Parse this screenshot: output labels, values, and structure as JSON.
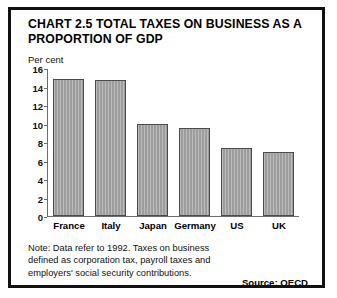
{
  "figure": {
    "title": "CHART 2.5 TOTAL TAXES ON BUSINESS AS A PROPORTION OF GDP",
    "note": "Note: Data refer to 1992. Taxes on business defined as corporation tax, payroll taxes and employers' social security contributions.",
    "source": "Source: OECD",
    "border_color": "#111111",
    "bar_color": "#9d9d9d",
    "bar_edge_color": "#4b4b4b"
  },
  "chart_data": {
    "type": "bar",
    "title": "CHART 2.5 TOTAL TAXES ON BUSINESS AS A PROPORTION OF GDP",
    "categories": [
      "France",
      "Italy",
      "Japan",
      "Germany",
      "US",
      "UK"
    ],
    "values": [
      14.8,
      14.7,
      10.0,
      9.5,
      7.3,
      6.9
    ],
    "xlabel": "",
    "ylabel": "Per cent",
    "ylim": [
      0,
      16
    ],
    "yticks": [
      0,
      2,
      4,
      6,
      8,
      10,
      12,
      14,
      16
    ],
    "grid": false,
    "legend": "none"
  }
}
